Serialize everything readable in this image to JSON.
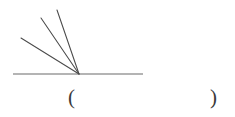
{
  "figure": {
    "type": "geometry-angle-diagram",
    "stroke_color": "#4a4a4a",
    "baseline_color": "#6b6b6b",
    "background_color": "#ffffff",
    "vertex": {
      "x": 79,
      "y": 74
    },
    "baseline": {
      "x1": 13,
      "y1": 74,
      "x2": 143,
      "y2": 74
    },
    "rays": [
      {
        "name": "ray-1-shallow",
        "x1": 79,
        "y1": 74,
        "x2": 21,
        "y2": 38
      },
      {
        "name": "ray-2-middle",
        "x1": 79,
        "y1": 74,
        "x2": 41,
        "y2": 18
      },
      {
        "name": "ray-3-steep",
        "x1": 79,
        "y1": 74,
        "x2": 57,
        "y2": 10
      }
    ]
  },
  "answer": {
    "open_paren": "(",
    "close_paren": ")",
    "value": ""
  }
}
